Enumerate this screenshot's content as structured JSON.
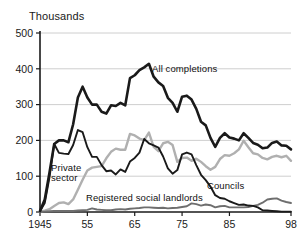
{
  "figure": {
    "background_color": "#ffffff",
    "axis_unit_label": "Thousands"
  },
  "annotations": {
    "all_completions": "All completions",
    "councils": "Councils",
    "private_sector_line1": "Private",
    "private_sector_line2": "sector",
    "registered_social_landlords": "Registered social landlords"
  },
  "chart_data": {
    "type": "line",
    "title": "",
    "subtitle": "",
    "xlabel": "",
    "ylabel": "Thousands",
    "xlim": [
      1945,
      1998
    ],
    "ylim": [
      0,
      500
    ],
    "yticks": [
      0,
      100,
      200,
      300,
      400,
      500
    ],
    "ytick_labels": [
      "0",
      "100",
      "200",
      "300",
      "400",
      "500"
    ],
    "xticks": [
      1945,
      1955,
      1965,
      1975,
      1985,
      1998
    ],
    "xtick_labels": [
      "1945",
      "55",
      "65",
      "75",
      "85",
      "98"
    ],
    "grid": "horizontal",
    "legend_position": "inline-annotations",
    "colors": {
      "all_completions": "#1a1a1a",
      "councils": "#1a1a1a",
      "private_sector": "#b0b0b0",
      "registered_social_landlords": "#6e6e6e",
      "gridline": "#c8c8c8",
      "axis": "#1a1a1a"
    },
    "x": [
      1945,
      1946,
      1947,
      1948,
      1949,
      1950,
      1951,
      1952,
      1953,
      1954,
      1955,
      1956,
      1957,
      1958,
      1959,
      1960,
      1961,
      1962,
      1963,
      1964,
      1965,
      1966,
      1967,
      1968,
      1969,
      1970,
      1971,
      1972,
      1973,
      1974,
      1975,
      1976,
      1977,
      1978,
      1979,
      1980,
      1981,
      1982,
      1983,
      1984,
      1985,
      1986,
      1987,
      1988,
      1989,
      1990,
      1991,
      1992,
      1993,
      1994,
      1995,
      1996,
      1997,
      1998
    ],
    "series": [
      {
        "name": "All completions",
        "color": "#1a1a1a",
        "linewidth": 2.6,
        "values": [
          3,
          35,
          110,
          190,
          200,
          200,
          195,
          245,
          320,
          350,
          320,
          300,
          300,
          280,
          275,
          298,
          296,
          305,
          298,
          374,
          382,
          396,
          404,
          414,
          378,
          362,
          352,
          319,
          305,
          280,
          322,
          325,
          314,
          288,
          252,
          242,
          207,
          182,
          207,
          220,
          208,
          205,
          200,
          220,
          207,
          193,
          188,
          178,
          180,
          193,
          197,
          186,
          185,
          175
        ]
      },
      {
        "name": "Councils",
        "color": "#1a1a1a",
        "linewidth": 1.9,
        "values": [
          2,
          25,
          97,
          190,
          165,
          163,
          162,
          187,
          229,
          223,
          181,
          154,
          154,
          131,
          114,
          116,
          105,
          119,
          112,
          141,
          151,
          166,
          204,
          192,
          186,
          180,
          155,
          122,
          107,
          117,
          161,
          166,
          161,
          131,
          104,
          89,
          71,
          47,
          39,
          37,
          30,
          25,
          20,
          21,
          18,
          17,
          13,
          5,
          4,
          3,
          2,
          1,
          1,
          1
        ]
      },
      {
        "name": "Private sector",
        "color": "#b0b0b0",
        "linewidth": 2.4,
        "values": [
          1,
          4,
          8,
          17,
          25,
          27,
          22,
          35,
          62,
          90,
          116,
          124,
          126,
          128,
          150,
          168,
          177,
          174,
          174,
          218,
          214,
          205,
          201,
          222,
          182,
          170,
          192,
          196,
          187,
          140,
          151,
          152,
          143,
          149,
          140,
          128,
          118,
          126,
          148,
          159,
          157,
          164,
          175,
          199,
          181,
          164,
          161,
          151,
          147,
          154,
          157,
          153,
          157,
          143
        ]
      },
      {
        "name": "Registered social landlords",
        "color": "#6e6e6e",
        "linewidth": 1.9,
        "values": [
          0,
          1,
          2,
          3,
          3,
          3,
          3,
          3,
          4,
          5,
          6,
          10,
          7,
          6,
          5,
          5,
          7,
          8,
          7,
          9,
          10,
          11,
          13,
          13,
          12,
          11,
          12,
          10,
          11,
          12,
          14,
          16,
          24,
          22,
          18,
          21,
          19,
          13,
          16,
          17,
          13,
          13,
          13,
          13,
          14,
          17,
          20,
          26,
          35,
          37,
          38,
          32,
          28,
          25
        ]
      }
    ]
  }
}
